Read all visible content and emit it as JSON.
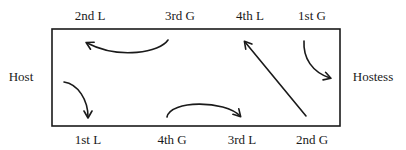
{
  "diagram": {
    "stroke_color": "#1a1a1a",
    "box": {
      "x": 52,
      "y": 29,
      "width": 288,
      "height": 97
    },
    "labels": {
      "top": [
        {
          "id": "top-2nd-l",
          "text": "2nd L",
          "x": 90,
          "y": 15
        },
        {
          "id": "top-3rd-g",
          "text": "3rd G",
          "x": 180,
          "y": 15
        },
        {
          "id": "top-4th-l",
          "text": "4th L",
          "x": 250,
          "y": 15
        },
        {
          "id": "top-1st-g",
          "text": "1st G",
          "x": 312,
          "y": 15
        }
      ],
      "bottom": [
        {
          "id": "bottom-1st-l",
          "text": "1st L",
          "x": 88,
          "y": 139
        },
        {
          "id": "bottom-4th-g",
          "text": "4th G",
          "x": 172,
          "y": 139
        },
        {
          "id": "bottom-3rd-l",
          "text": "3rd L",
          "x": 242,
          "y": 139
        },
        {
          "id": "bottom-2nd-g",
          "text": "2nd G",
          "x": 312,
          "y": 139
        }
      ],
      "left": {
        "id": "host",
        "text": "Host",
        "x": 21,
        "y": 76
      },
      "right": {
        "id": "hostess",
        "text": "Hostess",
        "x": 373,
        "y": 76
      }
    },
    "arrows": [
      {
        "id": "arrow-3rd-g-to-2nd-l",
        "from": "3rd G",
        "to": "2nd L",
        "path": "M168,40 C160,52 120,60 87,43"
      },
      {
        "id": "arrow-host-to-1st-l",
        "from": "Host",
        "to": "1st L",
        "path": "M64,82 C78,84 88,100 88,117"
      },
      {
        "id": "arrow-4th-g-to-3rd-l",
        "from": "4th G",
        "to": "3rd L",
        "path": "M167,117 C170,100 225,100 240,116"
      },
      {
        "id": "arrow-2nd-g-to-4th-l",
        "from": "2nd G",
        "to": "4th L",
        "path": "M306,116 L245,42"
      },
      {
        "id": "arrow-1st-g-to-hostess",
        "from": "1st G",
        "to": "Hostess",
        "path": "M304,41 C303,58 312,72 330,78"
      }
    ]
  }
}
